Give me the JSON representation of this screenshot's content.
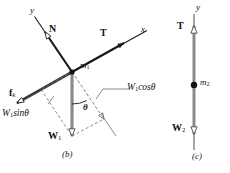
{
  "figure": {
    "background": "#ffffff",
    "ink": "#1a1a1a",
    "vector_gray": "#8a8a8a",
    "panels": [
      {
        "id": "panel-b",
        "caption": "(b)",
        "description": "free-body diagram of mass m1 on an inclined plane with tilted axes",
        "mass_label": "m",
        "mass_subscript": "1",
        "axes": [
          {
            "name": "y-axis",
            "label": "y"
          },
          {
            "name": "x-axis",
            "label": "x"
          }
        ],
        "vectors": [
          {
            "name": "normal-force",
            "label": "N",
            "subscript": "",
            "direction": "up-left"
          },
          {
            "name": "tension",
            "label": "T",
            "subscript": "",
            "direction": "up-right"
          },
          {
            "name": "friction",
            "label": "f",
            "subscript": "k",
            "direction": "down-left"
          },
          {
            "name": "weight",
            "label": "W",
            "subscript": "1",
            "direction": "down"
          }
        ],
        "angle_label": "θ",
        "components": [
          {
            "name": "weight-parallel-component",
            "text": "W",
            "subscript": "1",
            "trig": "sinθ"
          },
          {
            "name": "weight-perpendicular-component",
            "text": "W",
            "subscript": "1",
            "trig": "cosθ"
          }
        ]
      },
      {
        "id": "panel-c",
        "caption": "(c)",
        "description": "free-body diagram of hanging mass m2 on a vertical axis",
        "mass_label": "m",
        "mass_subscript": "2",
        "axes": [
          {
            "name": "y-axis",
            "label": "y"
          }
        ],
        "vectors": [
          {
            "name": "tension",
            "label": "T",
            "subscript": "",
            "direction": "up"
          },
          {
            "name": "weight",
            "label": "W",
            "subscript": "2",
            "direction": "down"
          }
        ]
      }
    ]
  }
}
